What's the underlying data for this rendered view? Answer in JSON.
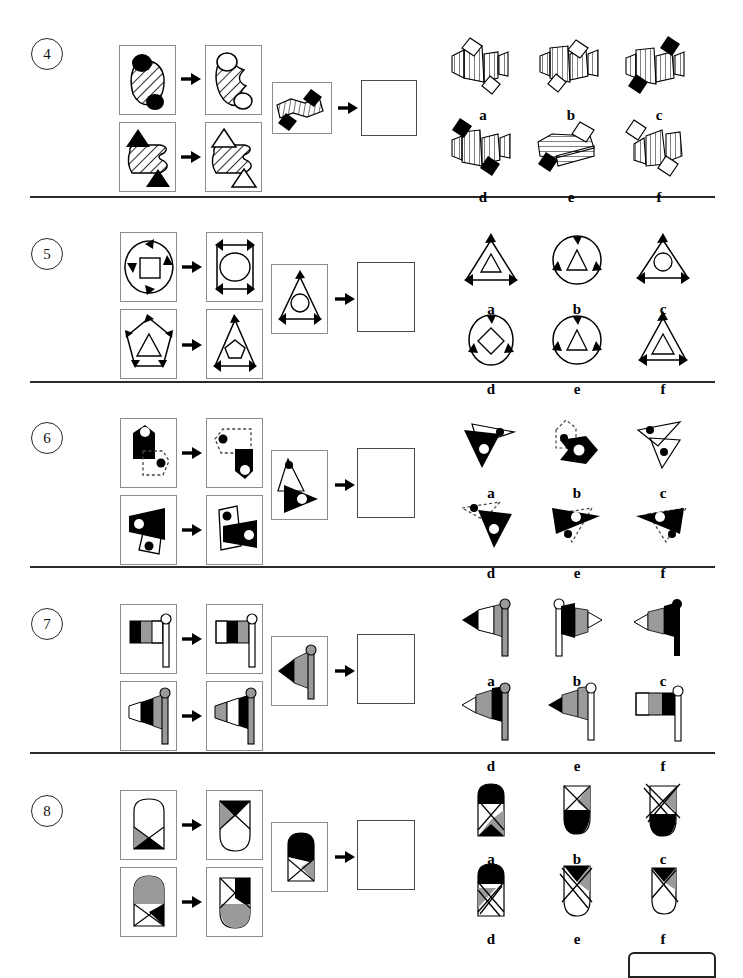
{
  "document": {
    "type": "visual-reasoning-test",
    "page_background": "#ffffff",
    "ink_color": "#000000",
    "grey_fill": "#9a9a9a",
    "box_border_color": "#8d8d8d",
    "separator_color": "#2a2a2a"
  },
  "option_labels": [
    "a",
    "b",
    "c",
    "d",
    "e",
    "f"
  ],
  "puzzles": [
    {
      "number": "4",
      "theme": "fan-shapes-with-diamonds",
      "top_row_label": "example-pair-1",
      "bottom_row_label": "example-pair-2",
      "prompt_label": "problem-figure",
      "answer_label": "answer-blank",
      "options": [
        "a",
        "b",
        "c",
        "d",
        "e",
        "f"
      ]
    },
    {
      "number": "5",
      "theme": "arrow-outlined-shapes-with-inner-shape",
      "top_row_label": "example-pair-1",
      "bottom_row_label": "example-pair-2",
      "prompt_label": "problem-figure",
      "answer_label": "answer-blank",
      "options": [
        "a",
        "b",
        "c",
        "d",
        "e",
        "f"
      ]
    },
    {
      "number": "6",
      "theme": "overlapping-polygons-with-dots",
      "top_row_label": "example-pair-1",
      "bottom_row_label": "example-pair-2",
      "prompt_label": "problem-figure",
      "answer_label": "answer-blank",
      "options": [
        "a",
        "b",
        "c",
        "d",
        "e",
        "f"
      ]
    },
    {
      "number": "7",
      "theme": "banded-flags-on-poles",
      "top_row_label": "example-pair-1",
      "bottom_row_label": "example-pair-2",
      "prompt_label": "problem-figure",
      "answer_label": "answer-blank",
      "options": [
        "a",
        "b",
        "c",
        "d",
        "e",
        "f"
      ]
    },
    {
      "number": "8",
      "theme": "shield-shapes-with-crossed-bands",
      "top_row_label": "example-pair-1",
      "bottom_row_label": "example-pair-2",
      "prompt_label": "problem-figure",
      "answer_label": "answer-blank",
      "options": [
        "a",
        "b",
        "c",
        "d",
        "e",
        "f"
      ]
    }
  ]
}
